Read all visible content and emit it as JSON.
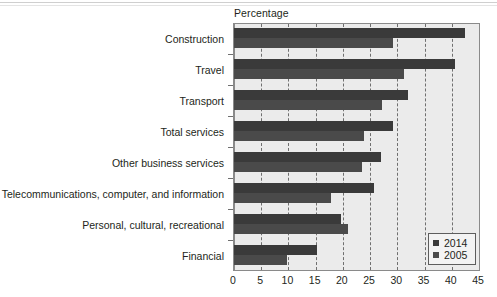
{
  "chart_data": {
    "type": "bar",
    "orientation": "horizontal",
    "title": "Percentage",
    "xlabel": "Percentage",
    "ylabel": "",
    "xlim": [
      0,
      45
    ],
    "xticks": [
      0,
      5,
      10,
      15,
      20,
      25,
      30,
      35,
      40,
      45
    ],
    "grid": "vertical-dashed",
    "legend_position": "bottom-right",
    "categories": [
      "Construction",
      "Travel",
      "Transport",
      "Total services",
      "Other business services",
      "Telecommunications, computer, and information",
      "Personal, cultural, recreational",
      "Financial"
    ],
    "series": [
      {
        "name": "2014",
        "color": "#3a3a3a",
        "values": [
          42.5,
          40.5,
          32.0,
          29.2,
          27.0,
          25.8,
          19.7,
          15.3
        ]
      },
      {
        "name": "2005",
        "color": "#4a4a4a",
        "values": [
          29.2,
          31.2,
          27.2,
          23.8,
          23.5,
          17.8,
          21.0,
          9.8
        ]
      }
    ]
  },
  "legend": {
    "items": [
      {
        "label": "2014",
        "color": "#3a3a3a"
      },
      {
        "label": "2005",
        "color": "#4a4a4a"
      }
    ]
  },
  "axis": {
    "title": "Percentage",
    "x_tick_labels": [
      "0",
      "5",
      "10",
      "15",
      "20",
      "25",
      "30",
      "35",
      "40",
      "45"
    ]
  }
}
